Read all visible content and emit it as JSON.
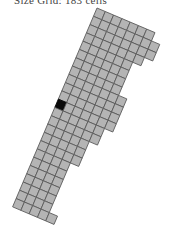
{
  "caption": "Size Grid: 183 cells",
  "grid": {
    "origin_x": 97,
    "origin_y": 8,
    "angle_deg": 23,
    "cell_size": 9,
    "fill_color": "#b4b4b4",
    "stroke_color": "#5a5a5a",
    "highlight_color": "#0a0a0a",
    "rows": [
      {
        "r": 0,
        "c0": 0,
        "c1": 6
      },
      {
        "r": 1,
        "c0": 0,
        "c1": 7
      },
      {
        "r": 2,
        "c0": 0,
        "c1": 7
      },
      {
        "r": 3,
        "c0": 0,
        "c1": 6
      },
      {
        "r": 4,
        "c0": 0,
        "c1": 5
      },
      {
        "r": 5,
        "c0": 0,
        "c1": 5
      },
      {
        "r": 6,
        "c0": 0,
        "c1": 5
      },
      {
        "r": 7,
        "c0": 0,
        "c1": 5
      },
      {
        "r": 8,
        "c0": 0,
        "c1": 6
      },
      {
        "r": 9,
        "c0": 0,
        "c1": 6
      },
      {
        "r": 10,
        "c0": 0,
        "c1": 6
      },
      {
        "r": 11,
        "c0": 0,
        "c1": 6
      },
      {
        "r": 12,
        "c0": 0,
        "c1": 5
      },
      {
        "r": 13,
        "c0": 0,
        "c1": 5
      },
      {
        "r": 14,
        "c0": 0,
        "c1": 4
      },
      {
        "r": 15,
        "c0": 0,
        "c1": 4
      },
      {
        "r": 16,
        "c0": 0,
        "c1": 4
      },
      {
        "r": 17,
        "c0": 0,
        "c1": 3
      },
      {
        "r": 18,
        "c0": 0,
        "c1": 3
      },
      {
        "r": 19,
        "c0": 0,
        "c1": 3
      },
      {
        "r": 20,
        "c0": 0,
        "c1": 3
      },
      {
        "r": 21,
        "c0": 0,
        "c1": 3
      },
      {
        "r": 22,
        "c0": 0,
        "c1": 3
      },
      {
        "r": 23,
        "c0": 0,
        "c1": 4
      }
    ],
    "highlight_cells": [
      {
        "r": 11,
        "c": 0
      }
    ]
  }
}
